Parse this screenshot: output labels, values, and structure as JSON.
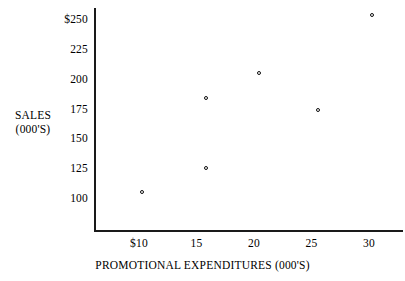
{
  "chart_data": {
    "type": "scatter",
    "title": "",
    "xlabel": "PROMOTIONAL EXPENDITURES (000'S)",
    "ylabel_line1": "SALES",
    "ylabel_line2": "(000'S)",
    "xlim": [
      7.5,
      32.5
    ],
    "ylim": [
      87,
      262
    ],
    "grid": false,
    "legend": null,
    "x_ticks": [
      {
        "value": 10,
        "label": "$10"
      },
      {
        "value": 15,
        "label": "15"
      },
      {
        "value": 20,
        "label": "20"
      },
      {
        "value": 25,
        "label": "25"
      },
      {
        "value": 30,
        "label": "30"
      }
    ],
    "y_ticks": [
      {
        "value": 250,
        "label": "$250"
      },
      {
        "value": 225,
        "label": "225"
      },
      {
        "value": 200,
        "label": "200"
      },
      {
        "value": 175,
        "label": "175"
      },
      {
        "value": 150,
        "label": "150"
      },
      {
        "value": 125,
        "label": "125"
      },
      {
        "value": 100,
        "label": "100"
      }
    ],
    "x": [
      10.3,
      15.8,
      15.8,
      20.4,
      25.6,
      30.3
    ],
    "y": [
      106,
      126,
      185,
      206,
      175,
      254
    ],
    "points": [
      {
        "x": 10.3,
        "y": 106
      },
      {
        "x": 15.8,
        "y": 126
      },
      {
        "x": 15.8,
        "y": 185
      },
      {
        "x": 20.4,
        "y": 206
      },
      {
        "x": 25.6,
        "y": 175
      },
      {
        "x": 30.3,
        "y": 254
      }
    ],
    "marker": "open-circle",
    "marker_color": "#101010",
    "background_color": "#ffffff",
    "axis_color": "#1a1a1a"
  }
}
